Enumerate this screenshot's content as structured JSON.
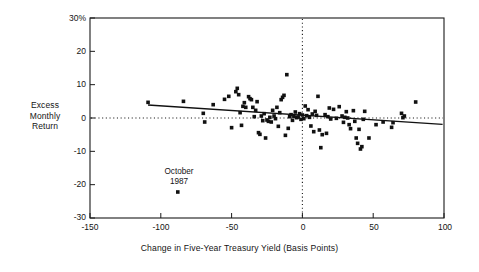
{
  "chart_data": {
    "type": "scatter",
    "title": "",
    "xlabel": "Change in Five-Year Treasury Yield (Basis Points)",
    "ylabel": "Excess Monthly Return",
    "ylabel_lines": [
      "Excess",
      "Monthly",
      "Return"
    ],
    "xlim": [
      -150,
      100
    ],
    "ylim": [
      -30,
      30
    ],
    "xticks": [
      -150,
      -100,
      -50,
      0,
      50,
      100
    ],
    "xtick_labels": [
      "-150",
      "-100",
      "-50",
      "0",
      "50",
      "100"
    ],
    "yticks": [
      -30,
      -20,
      -10,
      0,
      10,
      20,
      30
    ],
    "ytick_labels": [
      "-30",
      "-20",
      "-10",
      "0",
      "10",
      "20",
      "30%"
    ],
    "grid": false,
    "legend": "none",
    "reference_lines": [
      {
        "name": "zero-return-line",
        "orientation": "horizontal",
        "value": 0,
        "style": "dotted"
      },
      {
        "name": "zero-yield-change-line",
        "orientation": "vertical",
        "value": 0,
        "style": "dotted"
      }
    ],
    "trend_line": {
      "name": "regression-line",
      "style": "solid",
      "x_start": -109,
      "y_start": 3.9,
      "x_end": 99,
      "y_end": -1.9
    },
    "annotations": [
      {
        "name": "october-1987-annotation",
        "lines": [
          "October",
          "1987"
        ],
        "x": -88,
        "y": -17.0,
        "point_x": -88,
        "point_y": -22.2
      }
    ],
    "series": [
      {
        "name": "Excess Monthly Return vs Yield Change",
        "marker": "square",
        "color": "#111111",
        "points": [
          [
            -109,
            4.7
          ],
          [
            -84,
            5.0
          ],
          [
            -88,
            -22.2
          ],
          [
            -70,
            1.4
          ],
          [
            -69,
            -1.2
          ],
          [
            -63,
            4.0
          ],
          [
            -55,
            5.6
          ],
          [
            -52,
            6.5
          ],
          [
            -50,
            -2.9
          ],
          [
            -47,
            7.9
          ],
          [
            -46,
            8.9
          ],
          [
            -45,
            7.0
          ],
          [
            -44,
            1.6
          ],
          [
            -43,
            -2.2
          ],
          [
            -42,
            3.5
          ],
          [
            -41,
            4.6
          ],
          [
            -40,
            3.2
          ],
          [
            -38,
            6.4
          ],
          [
            -37,
            5.8
          ],
          [
            -36,
            5.5
          ],
          [
            -35,
            3.2
          ],
          [
            -34,
            0.4
          ],
          [
            -33,
            2.3
          ],
          [
            -32,
            4.9
          ],
          [
            -31,
            -4.4
          ],
          [
            -30,
            -4.9
          ],
          [
            -29,
            0.6
          ],
          [
            -28,
            -0.8
          ],
          [
            -27,
            1.3
          ],
          [
            -26,
            -6.0
          ],
          [
            -25,
            -0.6
          ],
          [
            -24,
            -1.0
          ],
          [
            -23,
            0.2
          ],
          [
            -22,
            -1.2
          ],
          [
            -21,
            2.3
          ],
          [
            -20,
            0.6
          ],
          [
            -19,
            -0.2
          ],
          [
            -18,
            3.2
          ],
          [
            -17,
            -2.5
          ],
          [
            -16,
            1.6
          ],
          [
            -15,
            5.5
          ],
          [
            -14,
            6.2
          ],
          [
            -13,
            6.8
          ],
          [
            -12,
            -5.2
          ],
          [
            -11,
            13.0
          ],
          [
            -10,
            -3.1
          ],
          [
            -9,
            0.4
          ],
          [
            -8,
            1.0
          ],
          [
            -7,
            -0.7
          ],
          [
            -6,
            0.5
          ],
          [
            -5,
            1.8
          ],
          [
            -4,
            0.1
          ],
          [
            -3,
            0.3
          ],
          [
            -2,
            1.3
          ],
          [
            -1,
            -0.4
          ],
          [
            0,
            0.9
          ],
          [
            1,
            -0.2
          ],
          [
            2,
            3.6
          ],
          [
            3,
            0.7
          ],
          [
            4,
            2.5
          ],
          [
            5,
            0.2
          ],
          [
            6,
            -2.4
          ],
          [
            7,
            1.2
          ],
          [
            8,
            -4.1
          ],
          [
            9,
            2.0
          ],
          [
            10,
            0.8
          ],
          [
            11,
            6.5
          ],
          [
            12,
            -3.6
          ],
          [
            13,
            -8.9
          ],
          [
            14,
            -5.0
          ],
          [
            16,
            1.0
          ],
          [
            17,
            -4.6
          ],
          [
            18,
            0.4
          ],
          [
            19,
            3.0
          ],
          [
            20,
            -0.3
          ],
          [
            22,
            2.6
          ],
          [
            24,
            -0.1
          ],
          [
            26,
            3.4
          ],
          [
            28,
            0.6
          ],
          [
            29,
            -1.3
          ],
          [
            30,
            0.2
          ],
          [
            31,
            1.9
          ],
          [
            32,
            0.0
          ],
          [
            33,
            -2.0
          ],
          [
            34,
            -3.2
          ],
          [
            36,
            2.2
          ],
          [
            37,
            -1.0
          ],
          [
            38,
            -6.0
          ],
          [
            39,
            -7.6
          ],
          [
            40,
            -3.4
          ],
          [
            41,
            -9.3
          ],
          [
            42,
            -8.6
          ],
          [
            43,
            -0.4
          ],
          [
            44,
            2.0
          ],
          [
            47,
            -6.0
          ],
          [
            52,
            -2.0
          ],
          [
            57,
            -1.2
          ],
          [
            63,
            -2.8
          ],
          [
            64,
            -1.4
          ],
          [
            70,
            1.4
          ],
          [
            71,
            0.1
          ],
          [
            72,
            0.6
          ],
          [
            80,
            4.8
          ]
        ]
      }
    ]
  },
  "axis_frame": {
    "name": "plot-frame",
    "left_px": 90,
    "right_px": 444,
    "top_px": 18,
    "bottom_px": 218
  }
}
